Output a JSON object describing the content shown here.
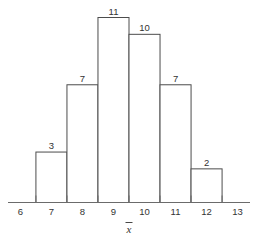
{
  "chart_data": {
    "type": "bar",
    "title": "",
    "subtitle": "",
    "xlabel": "x̄",
    "ylabel": "",
    "categories": [
      "7",
      "8",
      "9",
      "10",
      "11",
      "12"
    ],
    "values": [
      3,
      7,
      11,
      10,
      7,
      2
    ],
    "bin_edges": [
      6.5,
      7.5,
      8.5,
      9.5,
      10.5,
      11.5,
      12.5
    ],
    "data_labels": [
      "3",
      "7",
      "11",
      "10",
      "7",
      "2"
    ],
    "xlim": [
      5.6,
      13.4
    ],
    "ylim": [
      0,
      11
    ],
    "xticks": [
      6,
      7,
      8,
      9,
      10,
      11,
      12,
      13
    ],
    "xtick_labels": [
      "6",
      "7",
      "8",
      "9",
      "10",
      "11",
      "12",
      "13"
    ],
    "tick_positions": [
      6.5,
      7.5,
      8.5,
      9.5,
      10.5,
      11.5,
      12.5
    ],
    "grid": false,
    "legend": null,
    "bar_fill": "#ffffff",
    "bar_stroke": "#4c4c4c",
    "axis_color": "#6b6b6b",
    "text_color": "#333333",
    "background": "#ffffff"
  },
  "axis": {
    "x_title": "x",
    "x_title_overbar": true
  }
}
